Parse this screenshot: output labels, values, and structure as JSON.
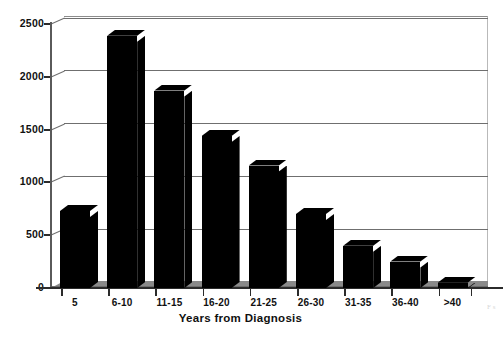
{
  "chart_data": {
    "type": "bar",
    "title": "",
    "subtitle": "",
    "xlabel": "Years from Diagnosis",
    "ylabel": "",
    "categories": [
      "5",
      "6-10",
      "11-15",
      "16-20",
      "21-25",
      "26-30",
      "31-35",
      "36-40",
      ">40"
    ],
    "values": [
      730,
      2390,
      1870,
      1440,
      1160,
      700,
      400,
      250,
      50
    ],
    "series": [
      {
        "name": "Patients",
        "values": [
          730,
          2390,
          1870,
          1440,
          1160,
          700,
          400,
          250,
          50
        ]
      }
    ],
    "ylim": [
      0,
      2500
    ],
    "ytick_labels": [
      "0",
      "500",
      "1000",
      "1500",
      "2000",
      "2500"
    ],
    "ytick_values": [
      0,
      500,
      1000,
      1500,
      2000,
      2500
    ],
    "grid": true,
    "grid_axis": "y",
    "legend": false,
    "legend_position": "none",
    "style": "3d-column",
    "bar_color": "#000000",
    "floor_color": "#8a8a8a",
    "gridline_color": "#6f6f6f",
    "axis_color": "#2b2b2b",
    "background_color": "#ffffff",
    "annotations": []
  },
  "artifact": {
    "edge_text": "F\ns"
  }
}
